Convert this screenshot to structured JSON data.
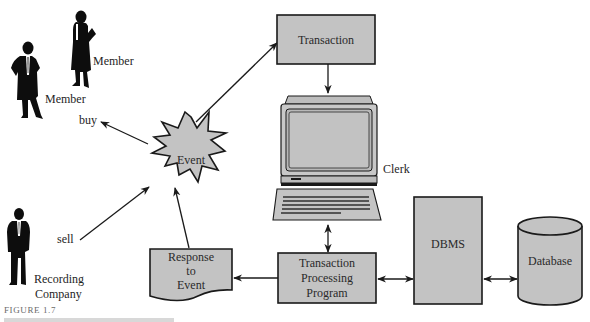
{
  "diagram": {
    "figure_caption": "FIGURE 1.7",
    "actors": {
      "member_1": "Member",
      "member_2": "Member",
      "recording_company_line1": "Recording",
      "recording_company_line2": "Company",
      "clerk": "Clerk"
    },
    "flows": {
      "buy": "buy",
      "sell": "sell"
    },
    "nodes": {
      "event": "Event",
      "transaction": "Transaction",
      "tpp_line1": "Transaction",
      "tpp_line2": "Processing",
      "tpp_line3": "Program",
      "response_line1": "Response",
      "response_line2": "to",
      "response_line3": "Event",
      "dbms": "DBMS",
      "database": "Database"
    },
    "colors": {
      "shape_fill": "#c3c3c3",
      "outline": "#1a1a1a",
      "silhouette": "#0d0d0d"
    }
  }
}
